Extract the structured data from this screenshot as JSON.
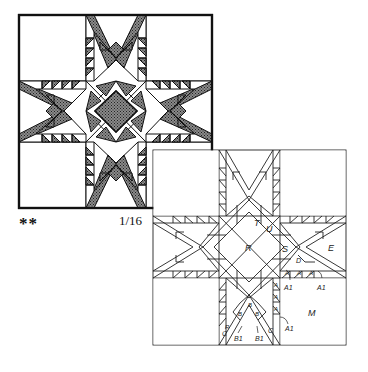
{
  "top_block": {
    "name": "Feathered Star quilt block (shaded)",
    "fill_dark": "#6b6b6b",
    "line_color": "#111111"
  },
  "captions": {
    "difficulty": "**",
    "scale": "1/16"
  },
  "piecing_diagram": {
    "name": "Feathered Star piecing diagram",
    "labels": {
      "R": "R",
      "T": "T",
      "U": "U",
      "S": "S",
      "E": "E",
      "D": "D",
      "M": "M",
      "A": "A",
      "A1": "A1",
      "B": "B",
      "B1": "B1",
      "C": "C",
      "Rc": "R"
    }
  }
}
